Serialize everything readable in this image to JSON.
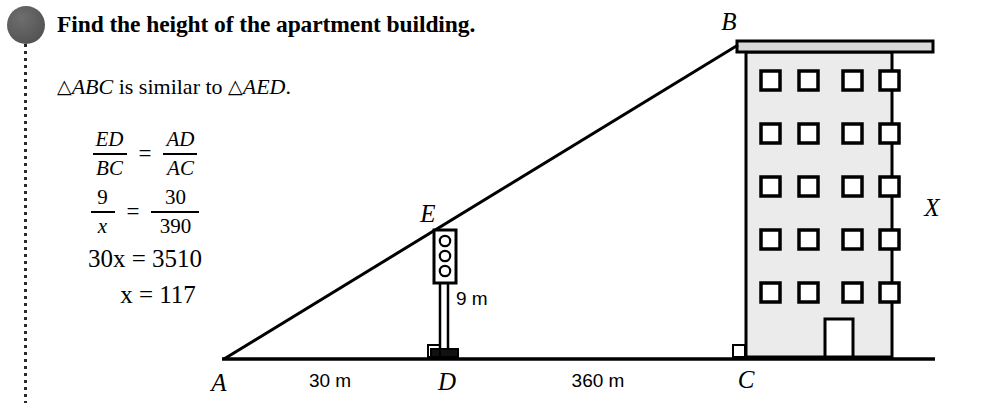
{
  "problem": {
    "headline": "Find the height of the apartment building.",
    "similarity": {
      "prefix": "",
      "triangle1": "ABC",
      "middle": " is similar to ",
      "triangle2": "AED",
      "suffix": "."
    },
    "equations": [
      {
        "id": "ratio-symbolic",
        "left": {
          "numerator": "ED",
          "denominator": "BC"
        },
        "operator": "=",
        "right": {
          "numerator": "AD",
          "denominator": "AC"
        }
      },
      {
        "id": "ratio-numeric",
        "left": {
          "numerator": "9",
          "denominator": "x"
        },
        "operator": "=",
        "right": {
          "numerator": "30",
          "denominator": "390"
        }
      },
      {
        "id": "cross-multiply",
        "text": "30x = 3510"
      },
      {
        "id": "solution",
        "text": "x = 117"
      }
    ]
  },
  "diagram": {
    "points": {
      "A": "A",
      "B": "B",
      "C": "C",
      "D": "D",
      "E": "E"
    },
    "measurements": {
      "base_left": "30 m",
      "base_right": "360 m",
      "pole_height": "9 m",
      "building_height": "X"
    },
    "building": {
      "window_rows": 5,
      "window_columns": 4,
      "fill": "#ebebeb",
      "stroke": "#000000"
    },
    "traffic_light": {
      "lamp_count": 3
    }
  },
  "colors": {
    "bullet": "#5a5a5a",
    "ink": "#000000",
    "page": "#ffffff",
    "building_fill": "#ebebeb"
  }
}
